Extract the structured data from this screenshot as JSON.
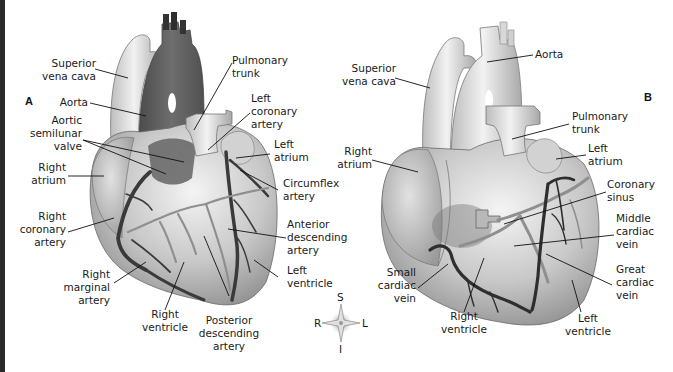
{
  "figure": {
    "panels": [
      {
        "id": "A",
        "title": "A",
        "view": "anterior",
        "labels": {
          "superior_vena_cava": "Superior\nvena cava",
          "aorta": "Aorta",
          "aortic_semilunar_valve": "Aortic\nsemilunar\nvalve",
          "right_atrium": "Right\natrium",
          "right_coronary_artery": "Right\ncoronary\nartery",
          "right_marginal_artery": "Right\nmarginal\nartery",
          "right_ventricle": "Right\nventricle",
          "posterior_descending_artery": "Posterior\ndescending\nartery",
          "pulmonary_trunk": "Pulmonary\ntrunk",
          "left_coronary_artery": "Left\ncoronary\nartery",
          "left_atrium": "Left\natrium",
          "circumflex_artery": "Circumflex\nartery",
          "anterior_descending_artery": "Anterior\ndescending\nartery",
          "left_ventricle": "Left\nventricle"
        }
      },
      {
        "id": "B",
        "title": "B",
        "view": "anterior-veins",
        "labels": {
          "superior_vena_cava": "Superior\nvena cava",
          "aorta": "Aorta",
          "right_atrium": "Right\natrium",
          "pulmonary_trunk": "Pulmonary\ntrunk",
          "left_atrium": "Left\natrium",
          "coronary_sinus": "Coronary\nsinus",
          "middle_cardiac_vein": "Middle\ncardiac\nvein",
          "great_cardiac_vein": "Great\ncardiac\nvein",
          "small_cardiac_vein": "Small\ncardiac\nvein",
          "right_ventricle": "Right\nventricle",
          "left_ventricle": "Left\nventricle"
        }
      }
    ],
    "compass": {
      "top": "S",
      "bottom": "I",
      "left": "R",
      "right": "L"
    },
    "colors": {
      "heart_light": "#e6e6e6",
      "heart_mid": "#bdbdbd",
      "heart_dark": "#8a8a8a",
      "aorta_dark": "#5e5e5e",
      "artery": "#3a3a3a",
      "vein_gray": "#8f8f8f",
      "leader_line": "#111111"
    }
  }
}
